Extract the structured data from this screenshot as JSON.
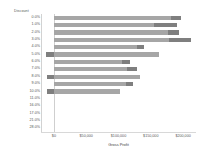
{
  "chart_data": {
    "type": "bar",
    "orientation": "horizontal",
    "stacked": true,
    "title": "",
    "category_axis_title": "Discount",
    "xlabel": "Gross Profit",
    "ylabel": "Discount",
    "xlim": [
      -20000,
      220000
    ],
    "xticks": [
      0,
      50000,
      100000,
      150000,
      200000
    ],
    "xtick_labels": [
      "$0",
      "$50,000",
      "$100,000",
      "$150,000",
      "$200,000"
    ],
    "grid": false,
    "legend": "none",
    "categories": [
      "0.0%",
      "1.0%",
      "2.0%",
      "3.0%",
      "4.0%",
      "5.0%",
      "6.0%",
      "7.0%",
      "8.0%",
      "9.0%",
      "10.0%",
      "11.0%",
      "16.0%",
      "17.0%",
      "21.0%",
      "28.0%"
    ],
    "series": [
      {
        "name": "light-segment",
        "color": "#a6a6a6",
        "values": [
          182000,
          155000,
          176000,
          178000,
          128000,
          151000,
          106000,
          113000,
          122000,
          112000,
          96000,
          0,
          0,
          0,
          0,
          0
        ]
      },
      {
        "name": "dark-segment",
        "color": "#7f7f7f",
        "values": [
          15000,
          36000,
          18000,
          34000,
          12000,
          12000,
          12000,
          15000,
          11000,
          10000,
          7000,
          0,
          0,
          0,
          0,
          0
        ]
      }
    ],
    "bars": [
      {
        "category": "0.0%",
        "start": 0,
        "light_end": 182000,
        "total": 197000,
        "dark_at": "right"
      },
      {
        "category": "1.0%",
        "start": 0,
        "light_end": 155000,
        "total": 191000,
        "dark_at": "right"
      },
      {
        "category": "2.0%",
        "start": 0,
        "light_end": 176000,
        "total": 194000,
        "dark_at": "right"
      },
      {
        "category": "3.0%",
        "start": 0,
        "light_end": 178000,
        "total": 212000,
        "dark_at": "right"
      },
      {
        "category": "4.0%",
        "start": 0,
        "light_end": 128000,
        "total": 140000,
        "dark_at": "middle"
      },
      {
        "category": "5.0%",
        "start": -12000,
        "light_end": 163000,
        "total": 163000,
        "dark_at": "left"
      },
      {
        "category": "6.0%",
        "start": 0,
        "light_end": 106000,
        "total": 118000,
        "dark_at": "middle"
      },
      {
        "category": "7.0%",
        "start": 0,
        "light_end": 113000,
        "total": 128000,
        "dark_at": "middle"
      },
      {
        "category": "8.0%",
        "start": -11000,
        "light_end": 133000,
        "total": 133000,
        "dark_at": "left"
      },
      {
        "category": "9.0%",
        "start": 0,
        "light_end": 112000,
        "total": 122000,
        "dark_at": "middle"
      },
      {
        "category": "10.0%",
        "start": -10000,
        "light_end": 103000,
        "total": 103000,
        "dark_at": "left"
      },
      {
        "category": "11.0%",
        "start": 0,
        "light_end": 0,
        "total": 0,
        "dark_at": "none"
      },
      {
        "category": "16.0%",
        "start": 0,
        "light_end": 0,
        "total": 0,
        "dark_at": "none"
      },
      {
        "category": "17.0%",
        "start": 0,
        "light_end": 0,
        "total": 0,
        "dark_at": "none"
      },
      {
        "category": "21.0%",
        "start": 0,
        "light_end": 0,
        "total": 0,
        "dark_at": "none"
      },
      {
        "category": "28.0%",
        "start": 0,
        "light_end": 0,
        "total": 0,
        "dark_at": "none"
      }
    ],
    "colors": {
      "light": "#a6a6a6",
      "dark": "#7f7f7f",
      "axis": "#d2d2d2",
      "text": "#555555"
    }
  }
}
